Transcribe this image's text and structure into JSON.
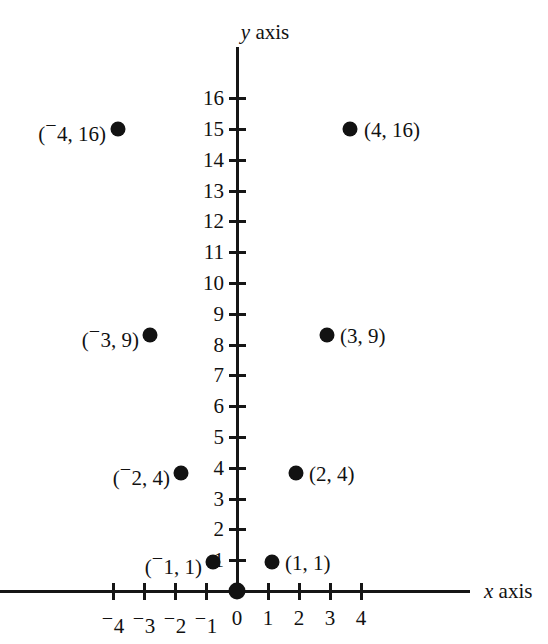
{
  "figure": {
    "width": 548,
    "height": 644,
    "background": "#ffffff",
    "ink_color": "#121212"
  },
  "axes": {
    "y_axis_name": "y axis",
    "y_axis_variable": "y",
    "y_axis_word": " axis",
    "x_axis_name": "x axis",
    "x_axis_variable": "x",
    "x_axis_word": " axis",
    "origin_label": "0"
  },
  "caption": {
    "text": ""
  },
  "chart_data": {
    "type": "scatter",
    "title": "",
    "subtitle": "",
    "xlabel": "x axis",
    "ylabel": "y axis",
    "grid": false,
    "legend": "none",
    "relation": "y = x squared",
    "xlim": [
      -4,
      4
    ],
    "ylim": [
      0,
      16
    ],
    "x_ticks": [
      -4,
      -3,
      -2,
      -1,
      0,
      1,
      2,
      3,
      4
    ],
    "x_tick_labels": [
      "⁻4",
      "⁻3",
      "⁻2",
      "⁻1",
      "0",
      "1",
      "2",
      "3",
      "4"
    ],
    "y_ticks": [
      1,
      2,
      3,
      4,
      5,
      6,
      7,
      8,
      9,
      10,
      11,
      12,
      13,
      14,
      15,
      16
    ],
    "y_tick_labels": [
      "1",
      "2",
      "3",
      "4",
      "5",
      "6",
      "7",
      "8",
      "9",
      "10",
      "11",
      "12",
      "13",
      "14",
      "15",
      "16"
    ],
    "series": [
      {
        "name": "y = x squared",
        "marker": "filled-circle",
        "color": "#121212",
        "points": [
          {
            "x": -4,
            "y": 16,
            "label": "(⁻4, 16)",
            "label_side": "left"
          },
          {
            "x": -3,
            "y": 9,
            "label": "(⁻3, 9)",
            "label_side": "left"
          },
          {
            "x": -2,
            "y": 4,
            "label": "(⁻2, 4)",
            "label_side": "left"
          },
          {
            "x": -1,
            "y": 1,
            "label": "(⁻1, 1)",
            "label_side": "left"
          },
          {
            "x": 0,
            "y": 0,
            "label": "",
            "label_side": "none"
          },
          {
            "x": 1,
            "y": 1,
            "label": "(1, 1)",
            "label_side": "right"
          },
          {
            "x": 2,
            "y": 4,
            "label": "(2, 4)",
            "label_side": "right"
          },
          {
            "x": 3,
            "y": 9,
            "label": "(3, 9)",
            "label_side": "right"
          },
          {
            "x": 4,
            "y": 16,
            "label": "(4, 16)",
            "label_side": "right"
          }
        ]
      }
    ]
  },
  "geometry": {
    "origin_px": {
      "x": 237,
      "y": 591
    },
    "x_tick_spacing_px": 31,
    "y_tick_spacing_px": 30.8,
    "y_axis_top_px": 47,
    "x_axis_left_px": 0,
    "x_axis_right_px": 470,
    "point_px": [
      {
        "cx": 118,
        "cy": 129
      },
      {
        "cx": 150,
        "cy": 335
      },
      {
        "cx": 181,
        "cy": 473
      },
      {
        "cx": 213,
        "cy": 562
      },
      {
        "cx": 237,
        "cy": 591
      },
      {
        "cx": 272,
        "cy": 562
      },
      {
        "cx": 296,
        "cy": 473
      },
      {
        "cx": 327,
        "cy": 335
      },
      {
        "cx": 350,
        "cy": 129
      }
    ],
    "point_label_px": [
      {
        "x": 106,
        "y": 130
      },
      {
        "x": 139,
        "y": 336
      },
      {
        "x": 170,
        "y": 474
      },
      {
        "x": 202,
        "y": 563
      },
      {
        "x": 0,
        "y": 0
      },
      {
        "x": 285,
        "y": 563
      },
      {
        "x": 309,
        "y": 474
      },
      {
        "x": 340,
        "y": 336
      },
      {
        "x": 364,
        "y": 130
      }
    ],
    "y_axis_name_px": {
      "x": 265,
      "y": 22
    },
    "x_axis_name_px": {
      "x": 484,
      "y": 591
    },
    "origin_label_px": {
      "x": 237,
      "y": 617
    },
    "caption_px": {
      "y": 634
    }
  }
}
